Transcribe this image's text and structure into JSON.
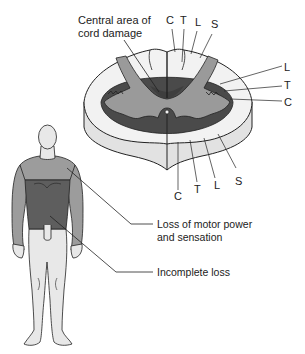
{
  "diagram": {
    "type": "anatomical illustration",
    "colors": {
      "white_matter": "#f2f2f2",
      "cord_side": "#e2e2e2",
      "gray_matter": "#9a9a9a",
      "damage_area": "#4a4a4a",
      "body_light": "#e8e8e8",
      "body_mid": "#9c9c9c",
      "body_dark": "#5e5e5e",
      "line": "#222222"
    },
    "cord": {
      "damage_label_line1": "Central area of",
      "damage_label_line2": "cord damage",
      "dorsal_labels": [
        "C",
        "T",
        "L",
        "S"
      ],
      "lateral_labels": [
        "L",
        "T",
        "C"
      ],
      "ventral_labels": [
        "C",
        "T",
        "L",
        "S"
      ]
    },
    "body": {
      "motor_label_line1": "Loss of motor power",
      "motor_label_line2": "and sensation",
      "incomplete_label": "Incomplete loss"
    }
  }
}
